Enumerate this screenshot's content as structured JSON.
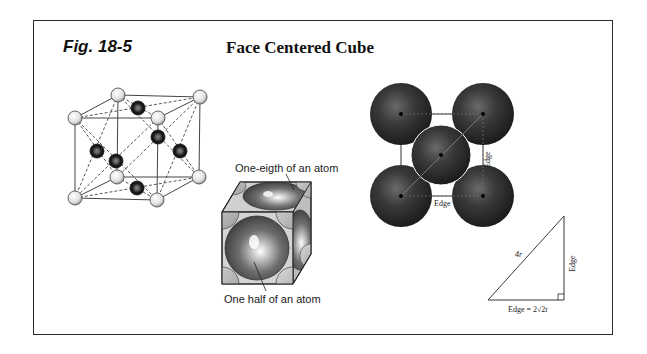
{
  "figure": {
    "label": "Fig. 18-5",
    "title": "Face Centered Cube"
  },
  "panels": {
    "lattice": {
      "description": "FCC unit cell with 8 corner atoms (light) and 6 face-center atoms (dark), dashed lines connecting face centers to corners"
    },
    "space_filling": {
      "label_top": "One-eigth of an atom",
      "label_bottom": "One half of an atom"
    },
    "face_view": {
      "edge_label_bottom": "Edge",
      "edge_label_right": "Edge"
    },
    "triangle": {
      "hypotenuse_label": "4r",
      "vertical_label": "Edge",
      "base_label": "Edge = 2√2r"
    }
  },
  "colors": {
    "border": "#2a2a2a",
    "corner_atom": "#e6e6e6",
    "face_atom": "#1e1e1e",
    "sphere_dark": "#2b2b2b"
  }
}
